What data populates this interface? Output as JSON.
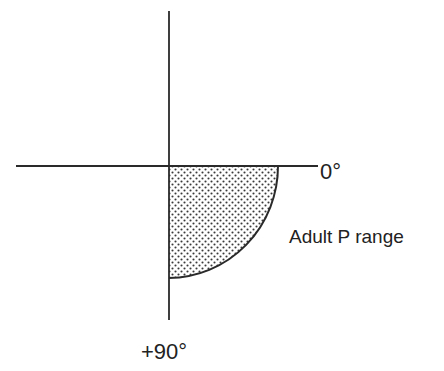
{
  "diagram": {
    "type": "angle-quadrant",
    "labels": {
      "horizontal_axis_end": "0°",
      "vertical_axis_end": "+90°",
      "shaded_region": "Adult P range"
    },
    "shaded_region": {
      "shape": "quarter-circle",
      "from_angle": "0°",
      "to_angle": "+90°",
      "fill": "stippled"
    },
    "colors": {
      "line": "#2a2a2a",
      "stipple_dot": "#3a3a3a",
      "background": "#ffffff"
    }
  }
}
